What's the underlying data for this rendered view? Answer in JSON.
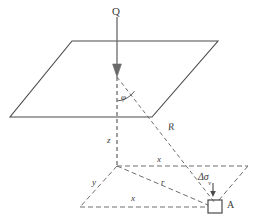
{
  "figure": {
    "type": "engineering-geometry-diagram",
    "background_color": "#ffffff",
    "line_color": "#4a4a4a",
    "dash_color": "#666666",
    "text_color": "#3a3a3a"
  },
  "labels": {
    "load": "Q",
    "angle": "φ",
    "slant_distance": "R",
    "depth": "z",
    "horizontal_x_upper": "x",
    "horizontal_x_lower": "x",
    "horizontal_y": "y",
    "radial_r": "r",
    "stress_increment": "Δσ",
    "stress_increment_subscript": "v",
    "point_a": "A"
  },
  "geometry": {
    "upper_plane": {
      "shape": "parallelogram",
      "vertices": [
        [
          72,
          41
        ],
        [
          218,
          41
        ],
        [
          152,
          117
        ],
        [
          10,
          117
        ]
      ]
    },
    "ground_plane": {
      "shape": "parallelogram",
      "vertices": [
        [
          117,
          166
        ],
        [
          248,
          166
        ],
        [
          215,
          207
        ],
        [
          80,
          207
        ]
      ]
    },
    "load_arrow": {
      "from": [
        117,
        17
      ],
      "to": [
        117,
        77
      ]
    },
    "angle_vertex": [
      117,
      77
    ],
    "angle_value_marker": "phi",
    "slant_line": {
      "from": [
        117,
        77
      ],
      "to": [
        215,
        207
      ]
    },
    "depth_line": {
      "from": [
        117,
        77
      ],
      "to": [
        117,
        166
      ]
    },
    "radial_line": {
      "from": [
        117,
        166
      ],
      "to": [
        215,
        207
      ]
    },
    "element_square": {
      "center": [
        215,
        207
      ],
      "size": 14
    },
    "indicator_arrow": {
      "from": [
        213,
        184
      ],
      "to": [
        213,
        197
      ]
    }
  }
}
